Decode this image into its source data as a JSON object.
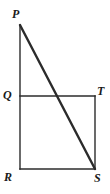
{
  "figure": {
    "type": "geometry-diagram",
    "background_color": "#ffffff",
    "stroke_color": "#2b2b2b",
    "label_color": "#1a1a1a",
    "canvas": {
      "width": 110,
      "height": 194
    },
    "points": {
      "P": {
        "label": "P",
        "x": 20,
        "y": 25
      },
      "Q": {
        "label": "Q",
        "x": 20,
        "y": 96
      },
      "T": {
        "label": "T",
        "x": 95,
        "y": 96
      },
      "R": {
        "label": "R",
        "x": 20,
        "y": 169
      },
      "S": {
        "label": "S",
        "x": 95,
        "y": 169
      }
    },
    "segments": [
      {
        "name": "PR",
        "from": "P",
        "to": "R",
        "x1": 20,
        "y1": 25,
        "x2": 20,
        "y2": 169,
        "width": 1.4
      },
      {
        "name": "QT",
        "from": "Q",
        "to": "T",
        "x1": 20,
        "y1": 96,
        "x2": 95,
        "y2": 96,
        "width": 1.4
      },
      {
        "name": "TS",
        "from": "T",
        "to": "S",
        "x1": 95,
        "y1": 96,
        "x2": 95,
        "y2": 169,
        "width": 1.4
      },
      {
        "name": "RS",
        "from": "R",
        "to": "S",
        "x1": 20,
        "y1": 169,
        "x2": 95,
        "y2": 169,
        "width": 1.4
      },
      {
        "name": "PS",
        "from": "P",
        "to": "S",
        "x1": 20,
        "y1": 25,
        "x2": 95,
        "y2": 169,
        "width": 2.4
      }
    ],
    "intersection": {
      "name": "PS-crosses-QT",
      "x": 57,
      "y": 96
    },
    "labels": [
      {
        "key": "P",
        "text": "P"
      },
      {
        "key": "Q",
        "text": "Q"
      },
      {
        "key": "T",
        "text": "T"
      },
      {
        "key": "R",
        "text": "R"
      },
      {
        "key": "S",
        "text": "S"
      }
    ]
  }
}
